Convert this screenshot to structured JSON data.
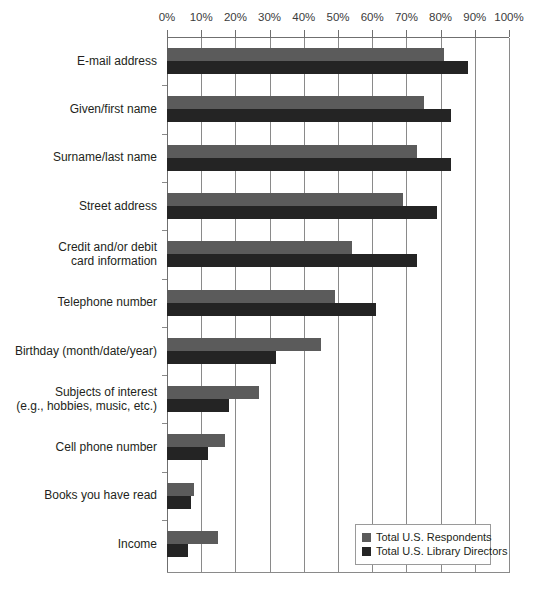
{
  "chart_data": {
    "type": "bar",
    "orientation": "horizontal",
    "title": "",
    "subtitle": "",
    "xlabel": "",
    "ylabel": "",
    "xlim": [
      0,
      100
    ],
    "grid": true,
    "axis_position": "top",
    "legend_position": "bottom-right",
    "tick_labels": [
      "0%",
      "10%",
      "20%",
      "30%",
      "40%",
      "50%",
      "60%",
      "70%",
      "80%",
      "90%",
      "100%"
    ],
    "tick_values": [
      0,
      10,
      20,
      30,
      40,
      50,
      60,
      70,
      80,
      90,
      100
    ],
    "categories": [
      "E-mail address",
      "Given/first name",
      "Surname/last name",
      "Street address",
      "Credit and/or debit card information",
      "Telephone number",
      "Birthday (month/date/year)",
      "Subjects of interest (e.g., hobbies, music, etc.)",
      "Cell phone number",
      "Books you have read",
      "Income"
    ],
    "category_lines": [
      [
        "E-mail address"
      ],
      [
        "Given/first name"
      ],
      [
        "Surname/last name"
      ],
      [
        "Street address"
      ],
      [
        "Credit and/or debit",
        "card information"
      ],
      [
        "Telephone number"
      ],
      [
        "Birthday (month/date/year)"
      ],
      [
        "Subjects of interest",
        "(e.g., hobbies, music, etc.)"
      ],
      [
        "Cell phone number"
      ],
      [
        "Books you have read"
      ],
      [
        "Income"
      ]
    ],
    "series": [
      {
        "name": "Total U.S. Respondents",
        "color": "#5b5b5b",
        "values": [
          81,
          75,
          73,
          69,
          54,
          49,
          45,
          27,
          17,
          8,
          15
        ]
      },
      {
        "name": "Total U.S. Library Directors",
        "color": "#242424",
        "values": [
          88,
          83,
          83,
          79,
          73,
          61,
          32,
          18,
          12,
          7,
          6
        ]
      }
    ]
  },
  "legend": {
    "entries": [
      {
        "label": "Total U.S. Respondents",
        "color": "#5b5b5b"
      },
      {
        "label": "Total U.S. Library Directors",
        "color": "#242424"
      }
    ]
  }
}
